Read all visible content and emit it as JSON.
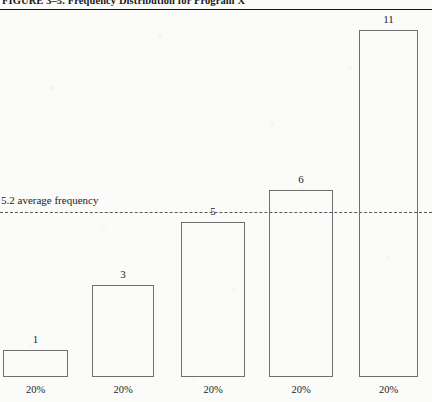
{
  "figure": {
    "caption": "FIGURE 3–5.  Frequency Distribution for Program X"
  },
  "reference_line": {
    "label": "5.2 average frequency",
    "value": 5.2
  },
  "chart_data": {
    "type": "bar",
    "title": "FIGURE 3–5.  Frequency Distribution for Program X",
    "xlabel": "",
    "ylabel": "",
    "categories": [
      "20%",
      "20%",
      "20%",
      "20%",
      "20%"
    ],
    "values": [
      1,
      3,
      5,
      6,
      11
    ],
    "value_labels": [
      "1",
      "3",
      "5",
      "6",
      "11"
    ],
    "ylim": [
      0,
      12
    ],
    "grid": false,
    "legend": null,
    "annotations": [
      {
        "type": "hline",
        "value": 5.2,
        "label": "5.2 average frequency",
        "style": "dashed"
      }
    ],
    "bar_style": {
      "fill": "none",
      "edge_color": "#6f6f6f"
    }
  },
  "bars": [
    {
      "value_label": "1",
      "x_label": "20%",
      "left": 3,
      "width": 65,
      "top": 350,
      "value_label_x": 23,
      "value_label_y": 333
    },
    {
      "value_label": "3",
      "x_label": "20%",
      "left": 92,
      "width": 62,
      "top": 285,
      "value_label_x": 112,
      "value_label_y": 268
    },
    {
      "value_label": "5",
      "x_label": "20%",
      "left": 181,
      "width": 64,
      "top": 222,
      "value_label_x": 202,
      "value_label_y": 205
    },
    {
      "value_label": "6",
      "x_label": "20%",
      "left": 269,
      "width": 64,
      "top": 190,
      "value_label_x": 290,
      "value_label_y": 173
    },
    {
      "value_label": "11",
      "x_label": "20%",
      "left": 359,
      "width": 59,
      "top": 30,
      "value_label_x": 377,
      "value_label_y": 13
    }
  ],
  "baseline_y": 377,
  "xlabel_y": 384
}
